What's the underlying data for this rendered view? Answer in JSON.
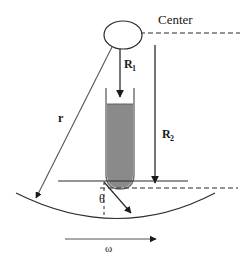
{
  "figure": {
    "title_visible": false,
    "background_color": "#ffffff",
    "labels": {
      "center": "Center",
      "r": "r",
      "R1_base": "R",
      "R1_sub": "1",
      "R2_base": "R",
      "R2_sub": "2",
      "theta": "θ",
      "omega": "ω"
    },
    "colors": {
      "line": "#2b2b2b",
      "thin_line": "#555555",
      "liquid_fill": "#8a8a8a",
      "tube_wall": "#6e6e6e",
      "text": "#1a1a1a"
    },
    "elements": {
      "rotor_hub": "ellipse",
      "tube": "rounded-bottom test tube with gray liquid",
      "center_line": "horizontal dashed line from hub",
      "bottom_arc": "rotation path arc",
      "omega_arrow": "angular velocity direction arrow",
      "r_arrow": "radius arrow from hub to arc",
      "R1_arrow": "distance from center to liquid surface",
      "R2_arrow": "distance from center to tube bottom",
      "theta_marker": "tube tilt angle from vertical"
    }
  }
}
